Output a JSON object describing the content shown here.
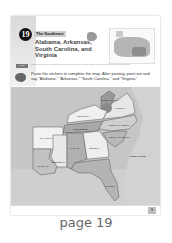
{
  "page": {
    "lesson_number": "19",
    "region_subtitle": "The Southeast",
    "title": "Alabama, Arkansas, South Carolina, and Virginia",
    "info_tag": "Fact",
    "info_text": "Small descriptive paragraph about the states in this region of the Southeast United States.",
    "instruction": "Paste the stickers to complete the map. After pasting, point out and say \"Alabama,\" \"Arkansas,\" \"South Carolina,\" and \"Virginia.\"",
    "map": {
      "ocean_label": "Atlantic Ocean",
      "states": [
        {
          "name": "Virginia",
          "label": "VIRGINIA"
        },
        {
          "name": "West Virginia",
          "label": "WEST VIRGINIA"
        },
        {
          "name": "Kentucky",
          "label": "KENTUCKY"
        },
        {
          "name": "Tennessee",
          "label": "TENNESSEE"
        },
        {
          "name": "North Carolina",
          "label": "NORTH CAROLINA"
        },
        {
          "name": "South Carolina",
          "label": "SOUTH CAROLINA"
        },
        {
          "name": "Arkansas",
          "label": "ARKANSAS"
        },
        {
          "name": "Louisiana",
          "label": "LOUISIANA"
        },
        {
          "name": "Mississippi",
          "label": "MISSISSIPPI"
        },
        {
          "name": "Alabama",
          "label": "ALABAMA"
        },
        {
          "name": "Georgia",
          "label": "GEORGIA"
        },
        {
          "name": "Florida",
          "label": "FLORIDA"
        }
      ]
    },
    "footer_page_number": "9"
  },
  "caption": "page 19"
}
